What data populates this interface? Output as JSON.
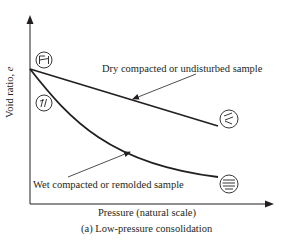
{
  "figure": {
    "caption": "(a) Low-pressure consolidation",
    "x_axis_label": "Pressure (natural scale)",
    "y_axis_label_text": "Void ratio, ",
    "y_axis_label_symbol": "e",
    "curves": [
      {
        "name": "dry",
        "label": "Dry compacted or undisturbed sample",
        "shape": "straight line, gentle decline",
        "start_icon": "flocculated-structure-symbol",
        "end_icon": "partially-oriented-structure-symbol"
      },
      {
        "name": "wet",
        "label": "Wet compacted or remolded sample",
        "shape": "concave curve, steeper decline",
        "start_icon": "dispersed-structure-symbol",
        "end_icon": "parallel-oriented-structure-symbol"
      }
    ],
    "colors": {
      "line": "#231f20",
      "background": "#ffffff"
    }
  }
}
